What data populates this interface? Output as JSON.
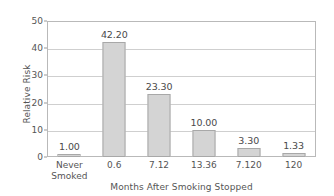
{
  "chart_data": {
    "type": "bar",
    "title": "",
    "xlabel": "Months After Smoking Stopped",
    "ylabel": "Relative Risk",
    "categories": [
      "Never\nSmoked",
      "0.6",
      "7.12",
      "13.36",
      "7.120",
      "120"
    ],
    "values": [
      1.0,
      42.2,
      23.3,
      10.0,
      3.3,
      1.33
    ],
    "data_labels": [
      "1.00",
      "42.20",
      "23.30",
      "10.00",
      "3.30",
      "1.33"
    ],
    "ylim": [
      0,
      50
    ],
    "yticks": [
      0,
      10,
      20,
      30,
      40,
      50
    ],
    "ytick_labels": [
      "0",
      "10",
      "20",
      "30",
      "40",
      "50"
    ],
    "grid": true,
    "grid_axis": "y",
    "legend": false,
    "bar_color": "#d4d4d4",
    "bar_border_color": "#a8a8a8",
    "axis_color": "#b9b9b9",
    "grid_color": "#cfcfcf",
    "text_color": "#555555",
    "background": "#ffffff"
  }
}
